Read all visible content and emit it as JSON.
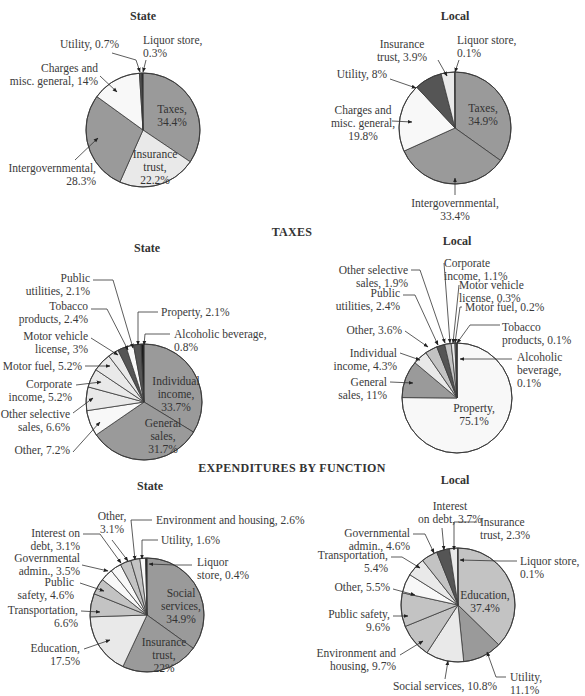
{
  "sections": {
    "taxes": "TAXES",
    "expenditures": "EXPENDITURES BY FUNCTION"
  },
  "subtitles": {
    "state": "State",
    "local": "Local"
  },
  "colors": {
    "dark": "#9a9a9a",
    "mid": "#c3c3c3",
    "light": "#e9e9e9",
    "white": "#f8f8f8",
    "charcoal": "#555555",
    "black": "#1c1c1c",
    "stroke": "#3a3a3a"
  },
  "chart_data": [
    {
      "type": "pie",
      "section": "Revenue",
      "title": "State",
      "slices": [
        {
          "label": "Taxes",
          "value": 34.4
        },
        {
          "label": "Insurance trust",
          "value": 22.2
        },
        {
          "label": "Intergovernmental",
          "value": 28.3
        },
        {
          "label": "Charges and misc. general",
          "value": 14
        },
        {
          "label": "Utility",
          "value": 0.7
        },
        {
          "label": "Liquor store",
          "value": 0.3
        }
      ]
    },
    {
      "type": "pie",
      "section": "Revenue",
      "title": "Local",
      "slices": [
        {
          "label": "Taxes",
          "value": 34.9
        },
        {
          "label": "Intergovernmental",
          "value": 33.4
        },
        {
          "label": "Charges and misc. general",
          "value": 19.8
        },
        {
          "label": "Utility",
          "value": 8
        },
        {
          "label": "Insurance trust",
          "value": 3.9
        },
        {
          "label": "Liquor store",
          "value": 0.1
        }
      ]
    },
    {
      "type": "pie",
      "section": "TAXES",
      "title": "State",
      "slices": [
        {
          "label": "Individual income",
          "value": 33.7
        },
        {
          "label": "General sales",
          "value": 31.7
        },
        {
          "label": "Other",
          "value": 7.2
        },
        {
          "label": "Other selective sales",
          "value": 6.6
        },
        {
          "label": "Corporate income",
          "value": 5.2
        },
        {
          "label": "Motor fuel",
          "value": 5.2
        },
        {
          "label": "Motor vehicle license",
          "value": 3
        },
        {
          "label": "Tobacco products",
          "value": 2.4
        },
        {
          "label": "Public utilities",
          "value": 2.1
        },
        {
          "label": "Property",
          "value": 2.1
        },
        {
          "label": "Alcoholic beverage",
          "value": 0.8
        }
      ]
    },
    {
      "type": "pie",
      "section": "TAXES",
      "title": "Local",
      "slices": [
        {
          "label": "Alcoholic beverage",
          "value": 0.1
        },
        {
          "label": "Property",
          "value": 75.1
        },
        {
          "label": "General sales",
          "value": 11
        },
        {
          "label": "Individual income",
          "value": 4.3
        },
        {
          "label": "Other",
          "value": 3.6
        },
        {
          "label": "Public utilities",
          "value": 2.4
        },
        {
          "label": "Other selective sales",
          "value": 1.9
        },
        {
          "label": "Corporate income",
          "value": 1.1
        },
        {
          "label": "Motor vehicle license",
          "value": 0.3
        },
        {
          "label": "Motor fuel",
          "value": 0.2
        },
        {
          "label": "Tobacco products",
          "value": 0.1
        }
      ]
    },
    {
      "type": "pie",
      "section": "EXPENDITURES BY FUNCTION",
      "title": "State",
      "slices": [
        {
          "label": "Social services",
          "value": 34.9
        },
        {
          "label": "Insurance trust",
          "value": 22
        },
        {
          "label": "Education",
          "value": 17.5
        },
        {
          "label": "Transportation",
          "value": 6.6
        },
        {
          "label": "Public safety",
          "value": 4.6
        },
        {
          "label": "Governmental admin.",
          "value": 3.5
        },
        {
          "label": "Interest on debt",
          "value": 3.1
        },
        {
          "label": "Other",
          "value": 3.1
        },
        {
          "label": "Environment and housing",
          "value": 2.6
        },
        {
          "label": "Utility",
          "value": 1.6
        },
        {
          "label": "Liquor store",
          "value": 0.4
        }
      ]
    },
    {
      "type": "pie",
      "section": "EXPENDITURES BY FUNCTION",
      "title": "Local",
      "slices": [
        {
          "label": "Education",
          "value": 37.4
        },
        {
          "label": "Utility",
          "value": 11.1
        },
        {
          "label": "Social services",
          "value": 10.8
        },
        {
          "label": "Environment and housing",
          "value": 9.7
        },
        {
          "label": "Public safety",
          "value": 9.6
        },
        {
          "label": "Other",
          "value": 5.5
        },
        {
          "label": "Transportation",
          "value": 5.4
        },
        {
          "label": "Governmental admin.",
          "value": 4.6
        },
        {
          "label": "Interest on debt",
          "value": 3.7
        },
        {
          "label": "Insurance trust",
          "value": 2.3
        },
        {
          "label": "Liquor store",
          "value": 0.1
        }
      ]
    }
  ],
  "labels": {
    "rev_state": {
      "utility": [
        "Utility, 0.7%"
      ],
      "liquor": [
        "Liquor store,",
        "0.3%"
      ],
      "charges": [
        "Charges and",
        "misc. general, 14%"
      ],
      "taxes": [
        "Taxes,",
        "34.4%"
      ],
      "insurance": [
        "Insurance",
        "trust,",
        "22.2%"
      ],
      "intergov": [
        "Intergovernmental,",
        "28.3%"
      ]
    },
    "rev_local": {
      "insurance": [
        "Insurance",
        "trust, 3.9%"
      ],
      "liquor": [
        "Liquor store,",
        "0.1%"
      ],
      "utility": [
        "Utility, 8%"
      ],
      "charges": [
        "Charges and",
        "misc. general,",
        "19.8%"
      ],
      "taxes": [
        "Taxes,",
        "34.9%"
      ],
      "intergov": [
        "Intergovernmental,",
        "33.4%"
      ]
    },
    "tax_state": {
      "public_util": [
        "Public",
        "utilities, 2.1%"
      ],
      "tobacco": [
        "Tobacco",
        "products, 2.4%"
      ],
      "mv_license": [
        "Motor vehicle",
        "license, 3%"
      ],
      "motor_fuel": [
        "Motor fuel, 5.2%"
      ],
      "corporate": [
        "Corporate",
        "income, 5.2%"
      ],
      "other_sel": [
        "Other selective",
        "sales, 6.6%"
      ],
      "other": [
        "Other, 7.2%"
      ],
      "property": [
        "Property, 2.1%"
      ],
      "alcohol": [
        "Alcoholic beverage,",
        "0.8%"
      ],
      "individual": [
        "Individual",
        "income,",
        "33.7%"
      ],
      "general": [
        "General",
        "sales,",
        "31.7%"
      ]
    },
    "tax_local": {
      "other_sel": [
        "Other selective",
        "sales, 1.9%"
      ],
      "public_util": [
        "Public",
        "utilities, 2.4%"
      ],
      "other": [
        "Other, 3.6%"
      ],
      "individual": [
        "Individual",
        "income, 4.3%"
      ],
      "general": [
        "General",
        "sales, 11%"
      ],
      "corporate": [
        "Corporate",
        "income, 1.1%"
      ],
      "mv_license": [
        "Motor vehicle",
        "license, 0.3%"
      ],
      "motor_fuel": [
        "Motor fuel, 0.2%"
      ],
      "tobacco": [
        "Tobacco",
        "products, 0.1%"
      ],
      "alcohol": [
        "Alcoholic",
        "beverage,",
        "0.1%"
      ],
      "property": [
        "Property,",
        "75.1%"
      ]
    },
    "exp_state": {
      "other": [
        "Other,",
        "3.1%"
      ],
      "env": [
        "Environment and housing, 2.6%"
      ],
      "interest": [
        "Interest on",
        "debt, 3.1%"
      ],
      "utility": [
        "Utility, 1.6%"
      ],
      "gov_admin": [
        "Governmental",
        "admin., 3.5%"
      ],
      "liquor": [
        "Liquor",
        "store, 0.4%"
      ],
      "public_safety": [
        "Public",
        "safety, 4.6%"
      ],
      "transport": [
        "Transportation,",
        "6.6%"
      ],
      "education": [
        "Education,",
        "17.5%"
      ],
      "social": [
        "Social",
        "services,",
        "34.9%"
      ],
      "insurance": [
        "Insurance",
        "trust,",
        "22%"
      ]
    },
    "exp_local": {
      "interest": [
        "Interest",
        "on debt, 3.7%"
      ],
      "insurance": [
        "Insurance",
        "trust, 2.3%"
      ],
      "gov_admin": [
        "Governmental",
        "admin., 4.6%"
      ],
      "transport": [
        "Transportation,",
        "5.4%"
      ],
      "liquor": [
        "Liquor store,",
        "0.1%"
      ],
      "other": [
        "Other, 5.5%"
      ],
      "education": [
        "Education,",
        "37.4%"
      ],
      "public_safety": [
        "Public safety,",
        "9.6%"
      ],
      "env": [
        "Environment and",
        "housing, 9.7%"
      ],
      "utility": [
        "Utility,",
        "11.1%"
      ],
      "social": [
        "Social services, 10.8%"
      ]
    }
  }
}
